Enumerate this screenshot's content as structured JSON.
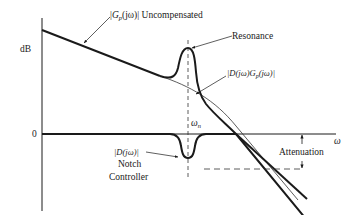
{
  "diagram": {
    "type": "bode-magnitude-notch-filter",
    "y_axis": {
      "label": "dB",
      "zero_label": "0"
    },
    "x_axis": {
      "label": "ω"
    },
    "annotations": {
      "uncompensated": {
        "prefix": "|",
        "main": "G",
        "sub": "p",
        "suffix": "(jω)| Uncompensated"
      },
      "resonance": "Resonance",
      "compensated": {
        "prefix": "|D(jω)G",
        "sub": "p",
        "suffix": "(jω)|"
      },
      "omega_n": {
        "main": "ω",
        "sub": "n"
      },
      "notch_expr": "|D(jω)|",
      "notch_line1": "Notch",
      "notch_line2": "Controller",
      "attenuation": "Attenuation"
    },
    "colors": {
      "ink": "#1a1a1a",
      "thin": "#333333"
    }
  }
}
